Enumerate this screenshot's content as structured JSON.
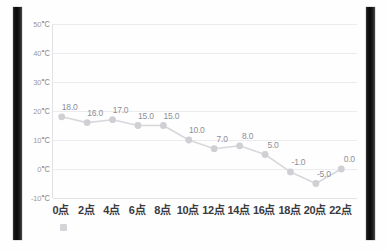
{
  "chart_data": {
    "type": "line",
    "title": "",
    "xlabel": "",
    "ylabel": "",
    "categories": [
      "0点",
      "2点",
      "4点",
      "6点",
      "8点",
      "10点",
      "12点",
      "14点",
      "16点",
      "18点",
      "20点",
      "22点"
    ],
    "values": [
      18.0,
      16.0,
      17.0,
      15.0,
      15.0,
      10.0,
      7.0,
      8.0,
      5.0,
      -1.0,
      -5.0,
      0.0
    ],
    "data_labels": [
      "18.0",
      "16.0",
      "17.0",
      "15.0",
      "15.0",
      "10.0",
      "7.0",
      "8.0",
      "5.0",
      "-1.0",
      "-5.0",
      "0.0"
    ],
    "ylim": [
      -10,
      50
    ],
    "yticks": [
      50,
      40,
      30,
      20,
      10,
      0,
      -10
    ],
    "ytick_labels": [
      "50℃",
      "40℃",
      "30℃",
      "20℃",
      "10℃",
      "0℃",
      "-10℃"
    ],
    "grid": true,
    "legend": "",
    "series": [
      {
        "name": "",
        "values": [
          18.0,
          16.0,
          17.0,
          15.0,
          15.0,
          10.0,
          7.0,
          8.0,
          5.0,
          -1.0,
          -5.0,
          0.0
        ]
      }
    ],
    "colors": {
      "line": "#d8d8dc",
      "marker": "#cfcfd4",
      "grid": "#ececf0",
      "axis_text": "#9a9aa2",
      "xaxis_text": "#3a3a3e",
      "data_label": "#8e8e96",
      "side_bar": "#0f0f0f",
      "background": "#ffffff"
    }
  },
  "decorations": {
    "faint_top_row": "",
    "legend_swatch_label": ""
  }
}
